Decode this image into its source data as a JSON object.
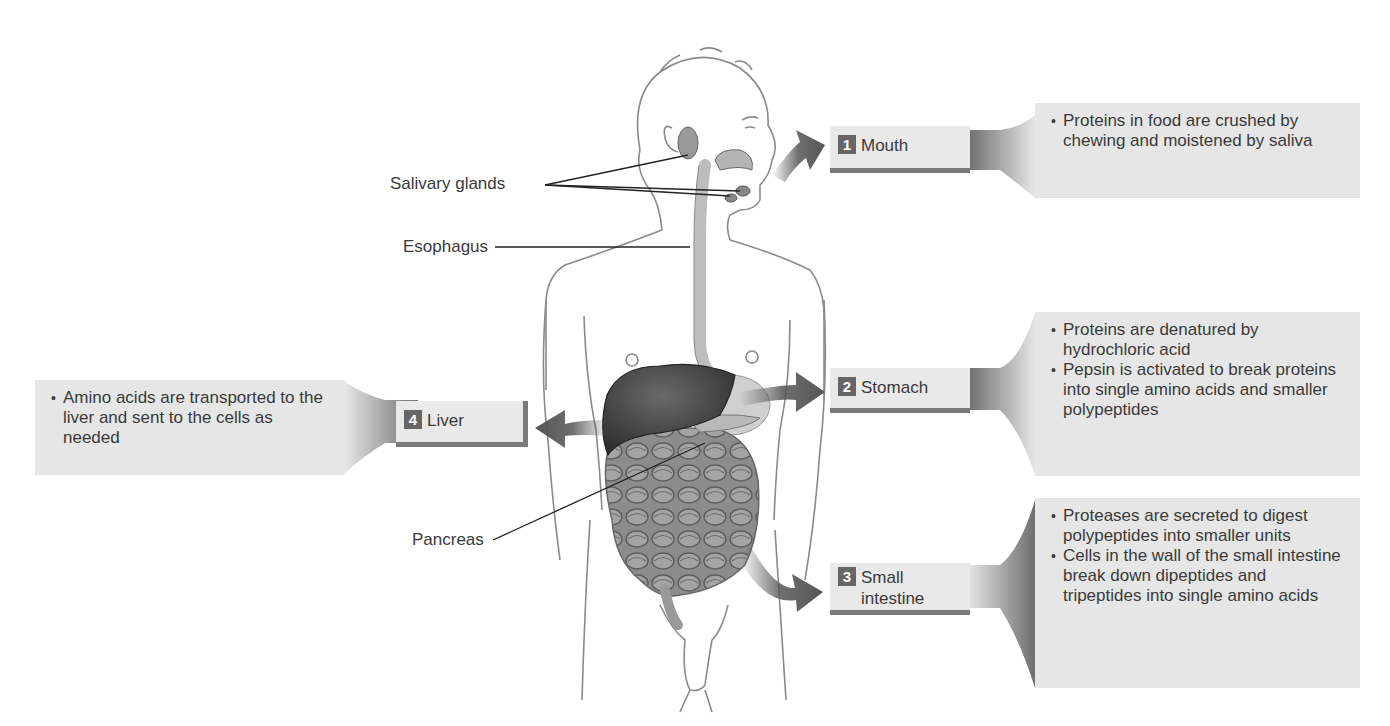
{
  "figure": {
    "colors": {
      "box_fill": "#e6e6e6",
      "badge_fill": "#666666",
      "arrow_fill": "#555555",
      "organ_dark": "#3a3a3a",
      "outline": "#8a8a8a"
    }
  },
  "anatomy_labels": {
    "salivary_glands": "Salivary glands",
    "esophagus": "Esophagus",
    "pancreas": "Pancreas"
  },
  "steps": [
    {
      "number": "1",
      "label": "Mouth",
      "points": [
        "Proteins in food are crushed by chewing and moistened by saliva"
      ]
    },
    {
      "number": "2",
      "label": "Stomach",
      "points": [
        "Proteins are denatured by hydrochloric acid",
        "Pepsin is activated to break proteins into single amino acids and smaller polypeptides"
      ]
    },
    {
      "number": "3",
      "label": "Small\nintestine",
      "points": [
        "Proteases are secreted to digest polypeptides into smaller units",
        "Cells in the wall of the small intestine break down dipeptides and tripeptides into single amino acids"
      ]
    },
    {
      "number": "4",
      "label": "Liver",
      "points": [
        "Amino acids are transported to the liver and sent to the cells as needed"
      ]
    }
  ]
}
